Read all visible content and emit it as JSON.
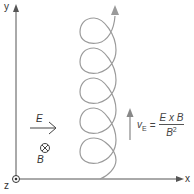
{
  "diagram": {
    "axes": {
      "x_label": "x",
      "y_label": "y",
      "z_label": "z",
      "origin_symbol": "out-of-page-dot"
    },
    "fields": {
      "E_label": "E",
      "E_direction": "right",
      "B_label": "B",
      "B_symbol": "⊗",
      "B_direction": "into-page"
    },
    "drift": {
      "velocity_symbol": "v",
      "velocity_subscript": "E",
      "equals": "=",
      "numerator": "E x B",
      "denominator_base": "B",
      "denominator_exponent": "2",
      "direction": "up"
    },
    "trajectory": {
      "type": "cycloid-helix",
      "loops": 5,
      "direction": "up"
    },
    "colors": {
      "axis": "#555555",
      "trajectory": "#999999",
      "arrow": "#888888",
      "text": "#333333"
    }
  }
}
